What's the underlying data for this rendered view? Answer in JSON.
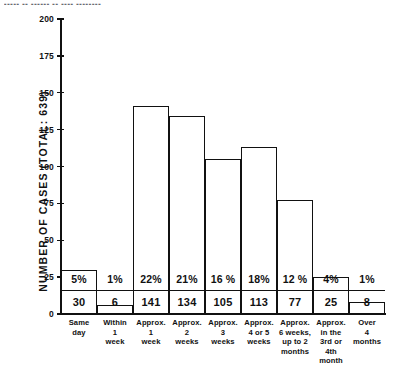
{
  "top_clipped_caption": "▪▪▪▪▪ ▪▪ ▪▪▪▪▪▪ ▪▪ ▪▪▪▪ ▪▪▪▪▪▪▪▪",
  "chart_data": {
    "type": "bar",
    "title": "",
    "xlabel": "",
    "ylabel": "NUMBER OF CASES  (TOTAL: 639)",
    "ylim": [
      0,
      200
    ],
    "ytick_values": [
      200,
      175,
      150,
      125,
      100,
      75,
      50,
      25,
      0
    ],
    "ytick_labels": [
      "200",
      "175",
      "150",
      "125",
      "100",
      "75",
      "50",
      "25",
      "0"
    ],
    "grid": false,
    "legend": null,
    "total_cases": 639,
    "categories": [
      "Same day",
      "Within 1 week",
      "Approx. 1 week",
      "Approx. 2 weeks",
      "Approx. 3 weeks",
      "Approx. 4 or 5 weeks",
      "Approx. 6 weeks, up to 2 months",
      "Approx. in the 3rd or 4th month",
      "Over 4 months"
    ],
    "category_lines": [
      [
        "Same",
        "day"
      ],
      [
        "Within",
        "1",
        "week"
      ],
      [
        "Approx.",
        "1",
        "week"
      ],
      [
        "Approx.",
        "2",
        "weeks"
      ],
      [
        "Approx.",
        "3",
        "weeks"
      ],
      [
        "Approx.",
        "4 or 5",
        "weeks"
      ],
      [
        "Approx.",
        "6 weeks,",
        "up to 2",
        "months"
      ],
      [
        "Approx.",
        "in the",
        "3rd or 4th",
        "month"
      ],
      [
        "Over",
        "4",
        "months"
      ]
    ],
    "values": [
      30,
      6,
      141,
      134,
      105,
      113,
      77,
      25,
      8
    ],
    "value_labels": [
      "30",
      "6",
      "141",
      "134",
      "105",
      "113",
      "77",
      "25",
      "8"
    ],
    "percent_labels": [
      "5%",
      "1%",
      "22%",
      "21%",
      "16 %",
      "18%",
      "12 %",
      "4%",
      "1%"
    ],
    "percent_values": [
      5,
      1,
      22,
      21,
      16,
      18,
      12,
      4,
      1
    ],
    "bar_style": {
      "fill": "#ffffff",
      "stroke": "#111111"
    }
  }
}
